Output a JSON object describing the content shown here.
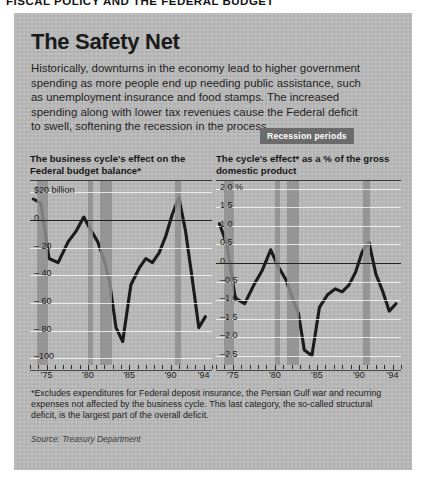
{
  "page": {
    "kicker": "FISCAL POLICY AND THE FEDERAL BUDGET"
  },
  "article": {
    "headline": "The Safety Net",
    "lede": "Historically, downturns in the economy lead to higher government spending as more people end up needing public assistance, such as unemployment insurance and food stamps. The increased spending along with lower tax revenues cause the Federal deficit to swell, softening the recession in the process.",
    "legend_badge": "Recession periods",
    "footnote": "*Excludes expenditures for Federal deposit insurance, the Persian Gulf war and recurring expenses not affected by the business cycle. This last category, the so-called structural deficit, is the largest part of the overall deficit.",
    "source": "Source: Treasury Department"
  },
  "colors": {
    "panel_background": "#b9b9b9",
    "recession_band": "#8e8e8e",
    "series_line": "#1b1b1b",
    "badge_background": "#6b6b6b",
    "gridline": "#ffffff",
    "zero_line": "#232323"
  },
  "chart_data": [
    {
      "id": "federal-budget-balance",
      "type": "line",
      "title": "The business cycle's effect on the Federal budget balance*",
      "xlabel": "",
      "ylabel": "$20 billion",
      "ytick_labels": [
        "$20 billion",
        "0",
        "– 20",
        "– 40",
        "– 60",
        "– 80",
        "–100"
      ],
      "ytick_values": [
        20,
        0,
        -20,
        -40,
        -60,
        -80,
        -100
      ],
      "ylim": [
        -105,
        28
      ],
      "xtick_labels": [
        "'75",
        "'80",
        "'85",
        "'90",
        "'94"
      ],
      "xtick_values": [
        1975,
        1980,
        1985,
        1990,
        1994
      ],
      "xlim": [
        1973,
        1995
      ],
      "grid": true,
      "legend": "Recession periods",
      "recession_bands": [
        {
          "start": 1973.9,
          "end": 1975.2
        },
        {
          "start": 1980.0,
          "end": 1980.6
        },
        {
          "start": 1981.5,
          "end": 1982.9
        },
        {
          "start": 1990.5,
          "end": 1991.3
        }
      ],
      "x": [
        1973.4,
        1974.3,
        1975.3,
        1976.4,
        1977.6,
        1978.6,
        1979.5,
        1980.3,
        1981.2,
        1982.0,
        1982.6,
        1983.4,
        1984.2,
        1985.2,
        1986.2,
        1987.0,
        1987.8,
        1988.6,
        1989.4,
        1990.2,
        1991.0,
        1991.8,
        1992.6,
        1993.4,
        1994.2
      ],
      "values": [
        15,
        12,
        -28,
        -31,
        -16,
        -8,
        2,
        -7,
        -16,
        -30,
        -44,
        -78,
        -88,
        -47,
        -35,
        -28,
        -31,
        -24,
        -12,
        4,
        16,
        -8,
        -42,
        -78,
        -70,
        -22
      ]
    },
    {
      "id": "cycle-effect-pct-gdp",
      "type": "line",
      "title": "The cycle's effect* as a % of the gross domestic product",
      "xlabel": "",
      "ylabel": "",
      "ytick_labels": [
        "2.0 %",
        "1.5",
        "1.0",
        "0.5",
        "0",
        "–0.5",
        "–1.0",
        "–1.5",
        "–2.0",
        "–2.5"
      ],
      "ytick_values": [
        2.0,
        1.5,
        1.0,
        0.5,
        0,
        -0.5,
        -1.0,
        -1.5,
        -2.0,
        -2.5
      ],
      "ylim": [
        -2.75,
        2.2
      ],
      "xtick_labels": [
        "'75",
        "'80",
        "'85",
        "'90",
        "'94"
      ],
      "xtick_values": [
        1975,
        1980,
        1985,
        1990,
        1994
      ],
      "xlim": [
        1973,
        1995
      ],
      "grid": true,
      "legend": "Recession periods",
      "recession_bands": [
        {
          "start": 1973.9,
          "end": 1975.2
        },
        {
          "start": 1980.0,
          "end": 1980.6
        },
        {
          "start": 1981.5,
          "end": 1982.9
        },
        {
          "start": 1990.5,
          "end": 1991.3
        }
      ],
      "x": [
        1973.4,
        1974.3,
        1975.3,
        1976.4,
        1977.5,
        1978.5,
        1979.5,
        1980.4,
        1981.3,
        1982.1,
        1982.8,
        1983.5,
        1984.4,
        1985.3,
        1986.3,
        1987.2,
        1988.0,
        1988.8,
        1989.6,
        1990.4,
        1991.2,
        1992.0,
        1992.8,
        1993.6,
        1994.4
      ],
      "values": [
        1.05,
        0.5,
        -0.95,
        -1.1,
        -0.6,
        -0.2,
        0.35,
        -0.1,
        -0.45,
        -0.95,
        -1.35,
        -2.35,
        -2.5,
        -1.2,
        -0.85,
        -0.7,
        -0.78,
        -0.6,
        -0.25,
        0.3,
        0.55,
        -0.3,
        -0.75,
        -1.3,
        -1.1,
        -0.4
      ]
    }
  ]
}
